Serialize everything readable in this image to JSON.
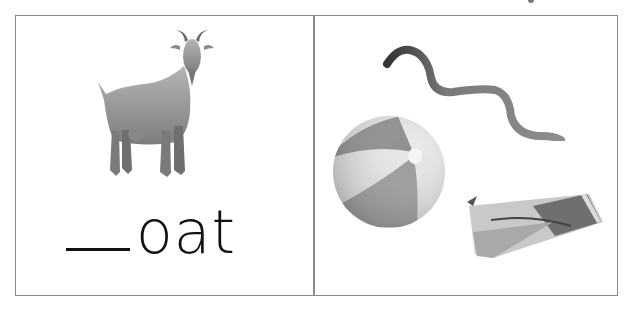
{
  "worksheet": {
    "left_panel": {
      "picture": "goat",
      "word_blank": "__",
      "word_suffix": "oat"
    },
    "right_panel": {
      "choices": [
        "worm",
        "ball",
        "gum"
      ]
    }
  }
}
